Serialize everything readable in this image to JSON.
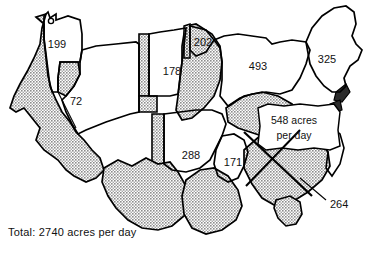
{
  "figure": {
    "kind": "thematic-map",
    "unit": "acres per day",
    "colors": {
      "outline": "#000000",
      "shaded_fill": "#b4b4b4",
      "plain_fill": "#ffffff",
      "text": "#111111",
      "background": "#ffffff"
    }
  },
  "regions": [
    {
      "id": "pacific-northwest",
      "value": "199",
      "shaded": false,
      "label_x": 57,
      "label_y": 45
    },
    {
      "id": "mountain-west",
      "value": "72",
      "shaded": false,
      "label_x": 76,
      "label_y": 102
    },
    {
      "id": "northern-plains",
      "value": "178",
      "shaded": false,
      "label_x": 172,
      "label_y": 72
    },
    {
      "id": "upper-midwest",
      "value": "202",
      "shaded": false,
      "label_x": 205,
      "label_y": 43
    },
    {
      "id": "great-lakes",
      "value": "493",
      "shaded": false,
      "label_x": 258,
      "label_y": 67
    },
    {
      "id": "northeast",
      "value": "325",
      "shaded": false,
      "label_x": 327,
      "label_y": 60
    },
    {
      "id": "central-plains",
      "value": "288",
      "shaded": false,
      "label_x": 191,
      "label_y": 156
    },
    {
      "id": "south-central",
      "value": "171",
      "shaded": false,
      "label_x": 233,
      "label_y": 163
    },
    {
      "id": "southeast",
      "value": "264",
      "shaded": true,
      "label_x": 330,
      "label_y": 203
    }
  ],
  "callout": {
    "id": "southeast-callout",
    "line1": "548 acres",
    "line2": "per day",
    "x": 294,
    "y1": 122,
    "y2": 137
  },
  "leader_label": {
    "id": "region-264-leader",
    "value": "264",
    "text_x": 330,
    "text_y": 204,
    "line": {
      "x1": 327,
      "y1": 200,
      "x2": 300,
      "y2": 178
    }
  },
  "total": {
    "text": "Total: 2740 acres per day",
    "value": "2740",
    "unit": "acres per day"
  }
}
